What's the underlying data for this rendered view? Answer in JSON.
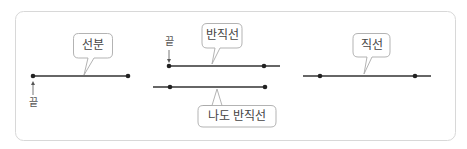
{
  "diagram": {
    "segment": {
      "label": "선분",
      "end_label": "끝"
    },
    "ray": {
      "label": "반직선",
      "end_label": "끝"
    },
    "ray_other": {
      "label": "나도 반직선"
    },
    "line": {
      "label": "직선"
    }
  },
  "colors": {
    "line": "#333333",
    "border": "#d8d8d8",
    "bubble_border": "#aaaaaa",
    "text": "#444444"
  }
}
